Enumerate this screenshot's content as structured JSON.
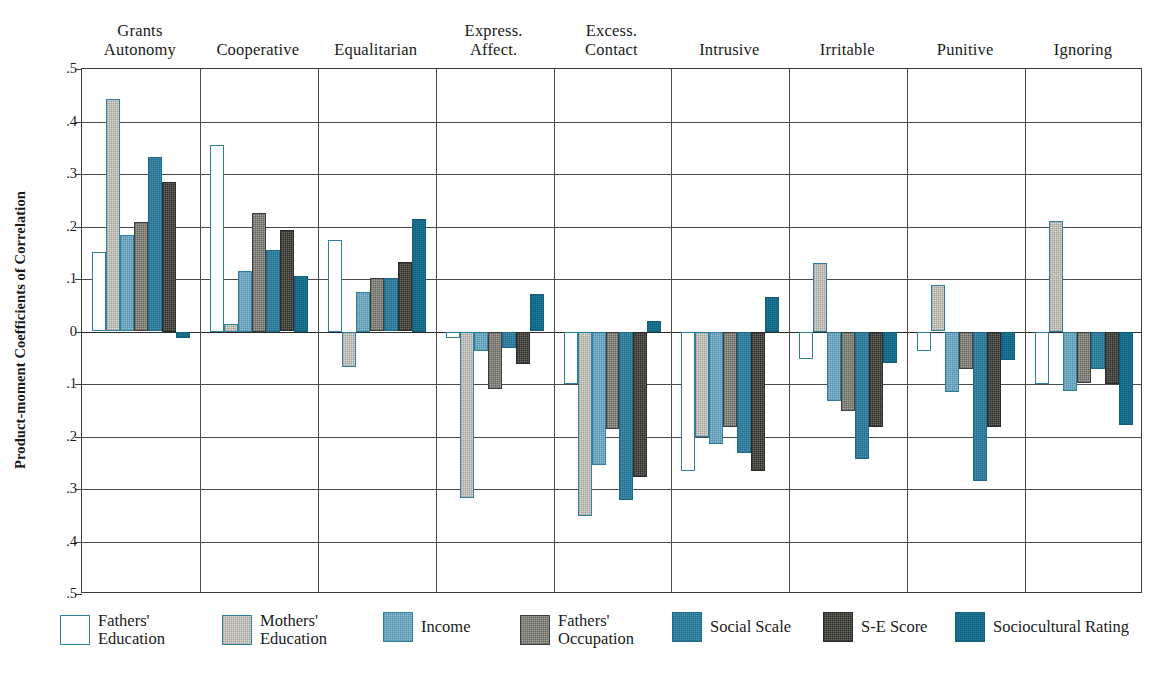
{
  "chart_data": {
    "type": "bar",
    "title": "",
    "xlabel": "",
    "ylabel": "Product-moment Coefficients of Correlation",
    "ylim": [
      -0.5,
      0.5
    ],
    "grid": true,
    "legend_position": "bottom",
    "ytick_labels": [
      ".5",
      ".4",
      ".3",
      ".2",
      ".1",
      "0",
      ".1",
      ".2",
      ".3",
      ".4",
      ".5"
    ],
    "ytick_values": [
      0.5,
      0.4,
      0.3,
      0.2,
      0.1,
      0.0,
      -0.1,
      -0.2,
      -0.3,
      -0.4,
      -0.5
    ],
    "categories": [
      "Grants\nAutonomy",
      "Cooperative",
      "Equalitarian",
      "Express.\nAffect.",
      "Excess.\nContact",
      "Intrusive",
      "Irritable",
      "Punitive",
      "Ignoring"
    ],
    "series": [
      {
        "name": "Fathers' Education",
        "color": "#ffffff",
        "values": [
          0.151,
          0.355,
          0.175,
          -0.012,
          -0.1,
          -0.265,
          -0.052,
          -0.038,
          -0.1
        ]
      },
      {
        "name": "Mothers' Education",
        "color": "#d9d9d2",
        "values": [
          0.443,
          0.015,
          -0.068,
          -0.318,
          -0.352,
          -0.2,
          0.13,
          0.088,
          0.21
        ]
      },
      {
        "name": "Income",
        "color": "#8cbdd2",
        "values": [
          0.183,
          0.115,
          0.075,
          -0.038,
          -0.255,
          -0.215,
          -0.132,
          -0.115,
          -0.113
        ]
      },
      {
        "name": "Fathers' Occupation",
        "color": "#a3a39a",
        "values": [
          0.209,
          0.225,
          0.102,
          -0.11,
          -0.185,
          -0.182,
          -0.152,
          -0.072,
          -0.098
        ]
      },
      {
        "name": "Social Scale",
        "color": "#3f93b4",
        "values": [
          0.332,
          0.155,
          0.102,
          -0.032,
          -0.32,
          -0.232,
          -0.242,
          -0.285,
          -0.072
        ]
      },
      {
        "name": "S-E Score",
        "color": "#6b6a62",
        "values": [
          0.285,
          0.194,
          0.132,
          -0.062,
          -0.278,
          -0.265,
          -0.182,
          -0.182,
          -0.1
        ]
      },
      {
        "name": "Sociocultural Rating",
        "color": "#1b7e9e",
        "values": [
          -0.013,
          0.105,
          0.215,
          0.072,
          0.02,
          0.065,
          -0.06,
          -0.055,
          -0.178
        ]
      }
    ]
  },
  "legend": {
    "items": [
      {
        "label": "Fathers'\nEducation"
      },
      {
        "label": "Mothers'\nEducation"
      },
      {
        "label": "Income"
      },
      {
        "label": "Fathers'\nOccupation"
      },
      {
        "label": "Social Scale"
      },
      {
        "label": "S-E Score"
      },
      {
        "label": "Sociocultural Rating"
      }
    ]
  }
}
